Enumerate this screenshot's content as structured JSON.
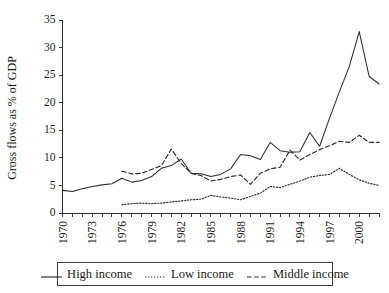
{
  "chart_data": {
    "type": "line",
    "title": "",
    "xlabel": "",
    "ylabel": "Gross flows as % of GDP",
    "xlim": [
      1970,
      2002
    ],
    "ylim": [
      0,
      35
    ],
    "yticks": [
      0,
      5,
      10,
      15,
      20,
      25,
      30,
      35
    ],
    "xticks_labeled": [
      1970,
      1973,
      1976,
      1979,
      1982,
      1985,
      1988,
      1991,
      1994,
      1997,
      2000
    ],
    "xticks_all": [
      1970,
      1971,
      1972,
      1973,
      1974,
      1975,
      1976,
      1977,
      1978,
      1979,
      1980,
      1981,
      1982,
      1983,
      1984,
      1985,
      1986,
      1987,
      1988,
      1989,
      1990,
      1991,
      1992,
      1993,
      1994,
      1995,
      1996,
      1997,
      1998,
      1999,
      2000,
      2001,
      2002
    ],
    "grid": false,
    "legend_position": "bottom",
    "series": [
      {
        "name": "High income",
        "style": "solid",
        "x": [
          1970,
          1971,
          1972,
          1973,
          1974,
          1975,
          1976,
          1977,
          1978,
          1979,
          1980,
          1981,
          1982,
          1983,
          1984,
          1985,
          1986,
          1987,
          1988,
          1989,
          1990,
          1991,
          1992,
          1993,
          1994,
          1995,
          1996,
          1997,
          1998,
          1999,
          2000,
          2001,
          2002
        ],
        "values": [
          4.1,
          3.9,
          4.4,
          4.8,
          5.1,
          5.3,
          6.3,
          5.6,
          5.9,
          6.6,
          8.1,
          8.6,
          9.8,
          7.2,
          7.1,
          6.6,
          7.0,
          8.0,
          10.6,
          10.4,
          9.7,
          12.8,
          11.3,
          11.0,
          11.1,
          14.6,
          12.1,
          17.2,
          22.0,
          26.6,
          32.9,
          24.8,
          23.4
        ]
      },
      {
        "name": "Low income",
        "style": "dotted",
        "x": [
          1976,
          1977,
          1978,
          1979,
          1980,
          1981,
          1982,
          1983,
          1984,
          1985,
          1986,
          1987,
          1988,
          1989,
          1990,
          1991,
          1992,
          1993,
          1994,
          1995,
          1996,
          1997,
          1998,
          1999,
          2000,
          2001,
          2002
        ],
        "values": [
          1.5,
          1.7,
          1.8,
          1.7,
          1.8,
          2.0,
          2.2,
          2.4,
          2.5,
          3.2,
          2.9,
          2.7,
          2.4,
          3.0,
          3.6,
          4.8,
          4.6,
          5.2,
          5.8,
          6.5,
          6.8,
          7.0,
          8.1,
          7.0,
          6.0,
          5.4,
          5.0
        ]
      },
      {
        "name": "Middle income",
        "style": "dashed",
        "x": [
          1976,
          1977,
          1978,
          1979,
          1980,
          1981,
          1982,
          1983,
          1984,
          1985,
          1986,
          1987,
          1988,
          1989,
          1990,
          1991,
          1992,
          1993,
          1994,
          1995,
          1996,
          1997,
          1998,
          1999,
          2000,
          2001,
          2002
        ],
        "values": [
          7.6,
          7.1,
          7.2,
          7.9,
          8.6,
          11.6,
          9.0,
          7.2,
          6.8,
          5.8,
          6.1,
          6.6,
          6.9,
          5.2,
          7.2,
          8.0,
          8.3,
          11.4,
          9.6,
          10.6,
          11.5,
          12.2,
          13.0,
          12.8,
          14.1,
          12.8,
          12.8
        ]
      }
    ]
  },
  "legend": {
    "items": [
      {
        "label": "High income",
        "style": "solid"
      },
      {
        "label": "Low income",
        "style": "dotted"
      },
      {
        "label": "Middle income",
        "style": "dashed"
      }
    ]
  }
}
